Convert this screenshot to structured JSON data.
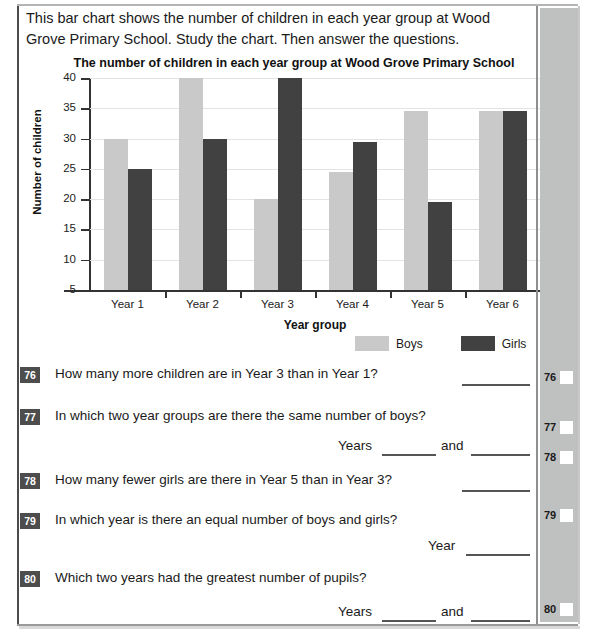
{
  "intro": {
    "text": "This bar chart shows the number of children in each year group at Wood Grove Primary School. Study the chart. Then answer the questions."
  },
  "chart_data": {
    "type": "bar",
    "title": "The number of children in each year group at Wood Grove Primary School",
    "xlabel": "Year group",
    "ylabel": "Number of children",
    "categories": [
      "Year 1",
      "Year 2",
      "Year 3",
      "Year 4",
      "Year 5",
      "Year 6"
    ],
    "series": [
      {
        "name": "Boys",
        "color": "#c9c9c9",
        "values": [
          30,
          40,
          20,
          24.5,
          34.5,
          34.5
        ]
      },
      {
        "name": "Girls",
        "color": "#414141",
        "values": [
          25,
          30,
          40,
          29.5,
          19.5,
          34.5
        ]
      }
    ],
    "ylim": [
      5,
      40
    ],
    "yticks": [
      5,
      10,
      15,
      20,
      25,
      30,
      35,
      40
    ],
    "grid": true,
    "legend_position": "bottom-right"
  },
  "questions": [
    {
      "number": "76",
      "text": "How many more children are in Year 3 than in Year 1?",
      "answer_prefix": "",
      "answer_joiner": ""
    },
    {
      "number": "77",
      "text": "In which two year groups are there the same number of boys?",
      "answer_prefix": "Years",
      "answer_joiner": "and"
    },
    {
      "number": "78",
      "text": "How many fewer girls are there in Year 5 than in Year 3?",
      "answer_prefix": "",
      "answer_joiner": ""
    },
    {
      "number": "79",
      "text": "In which year is there an equal number of boys and girls?",
      "answer_prefix": "Year",
      "answer_joiner": ""
    },
    {
      "number": "80",
      "text": "Which two years had the greatest number of pupils?",
      "answer_prefix": "Years",
      "answer_joiner": "and"
    }
  ],
  "margin_marks": [
    {
      "number": "76"
    },
    {
      "number": "77"
    },
    {
      "number": "78"
    },
    {
      "number": "79"
    },
    {
      "number": "80"
    }
  ]
}
